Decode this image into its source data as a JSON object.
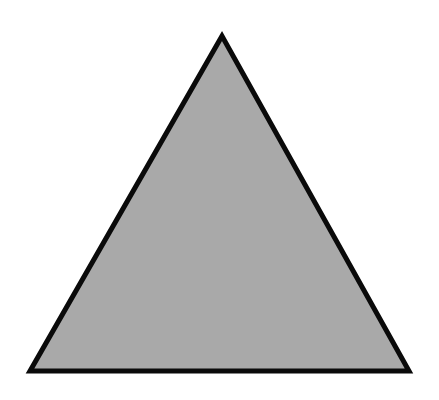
{
  "diagram": {
    "shape": "triangle",
    "fill_color": "#a9a9a9",
    "stroke_color": "#0a0a0a",
    "stroke_width": 5,
    "vertices": {
      "apex": [
        222,
        36
      ],
      "bottom_left": [
        30,
        371
      ],
      "bottom_right": [
        409,
        371
      ]
    },
    "background_color": "#ffffff"
  }
}
